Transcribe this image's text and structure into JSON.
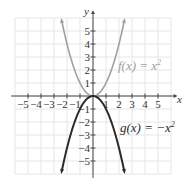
{
  "chart_data": {
    "type": "line",
    "title": "",
    "xlabel": "x",
    "ylabel": "y",
    "xlim": [
      -6,
      6
    ],
    "ylim": [
      -6,
      6
    ],
    "grid": true,
    "x_ticks": [
      -5,
      -4,
      -3,
      -2,
      -1,
      1,
      2,
      3,
      4,
      5
    ],
    "y_ticks": [
      -5,
      -4,
      -3,
      -2,
      -1,
      1,
      2,
      3,
      4,
      5
    ],
    "x_tick_labels": [
      "−5",
      "−4",
      "−3",
      "−2",
      "−1",
      "1",
      "2",
      "3",
      "4",
      "5"
    ],
    "y_tick_labels": [
      "−5",
      "−4",
      "−3",
      "−2",
      "−1",
      "1",
      "2",
      "3",
      "4",
      "5"
    ],
    "series": [
      {
        "name": "f(x) = x²",
        "formula": "x^2",
        "color": "#a0a0a0",
        "x": [
          -2.45,
          -2,
          -1.5,
          -1,
          -0.5,
          0,
          0.5,
          1,
          1.5,
          2,
          2.45
        ],
        "values": [
          6.0,
          4,
          2.25,
          1,
          0.25,
          0,
          0.25,
          1,
          2.25,
          4,
          6.0
        ]
      },
      {
        "name": "g(x) = −x²",
        "formula": "-x^2",
        "color": "#2b2b2b",
        "x": [
          -2.45,
          -2,
          -1.5,
          -1,
          -0.5,
          0,
          0.5,
          1,
          1.5,
          2,
          2.45
        ],
        "values": [
          -6.0,
          -4,
          -2.25,
          -1,
          -0.25,
          0,
          -0.25,
          -1,
          -2.25,
          -4,
          -6.0
        ]
      }
    ],
    "annotations": [
      {
        "text": "f(x) = x²",
        "x": 2.1,
        "y": 2.3
      },
      {
        "text": "g(x) = −x²",
        "x": 2.1,
        "y": -2.5
      }
    ]
  },
  "labels": {
    "x_axis": "x",
    "y_axis": "y",
    "f_prefix": "f(x) = x",
    "f_exp": "2",
    "g_prefix": "g(x) = −x",
    "g_exp": "2"
  },
  "colors": {
    "grid": "#e6e6e6",
    "axis": "#444444",
    "f_curve": "#a0a0a0",
    "g_curve": "#2b2b2b"
  }
}
